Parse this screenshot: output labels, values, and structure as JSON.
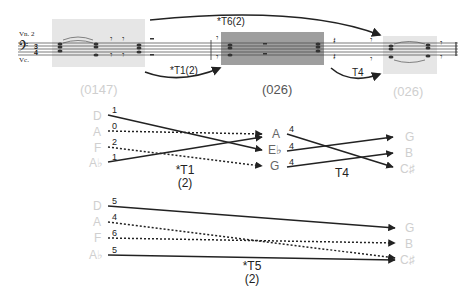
{
  "score": {
    "instrument_labels": [
      "Vn. 2",
      "Vc."
    ],
    "highlight_boxes": [
      {
        "name": "first-segment",
        "color": "#e6e6e6"
      },
      {
        "name": "middle-segment",
        "color": "#9e9e9e"
      },
      {
        "name": "last-segment",
        "color": "#e6e6e6"
      }
    ],
    "arrows": [
      {
        "label": "*T6(2)",
        "from": "first-segment",
        "to": "last-segment",
        "position": "above"
      },
      {
        "label": "*T1(2)",
        "from": "first-segment",
        "to": "middle-segment",
        "position": "below"
      },
      {
        "label": "T4",
        "from": "middle-segment",
        "to": "last-segment",
        "position": "below"
      }
    ],
    "set_labels": [
      {
        "text": "(0147)",
        "color": "#cfcfcf"
      },
      {
        "text": "(026)",
        "color": "#555555"
      },
      {
        "text": "(026)",
        "color": "#cfcfcf"
      }
    ]
  },
  "mapping_top": {
    "source": [
      "D",
      "A",
      "F",
      "A♭"
    ],
    "middle": [
      "A",
      "E♭",
      "G"
    ],
    "target": [
      "G",
      "B",
      "C♯"
    ],
    "first_operation": {
      "label": "*T1",
      "sub": "(2)"
    },
    "second_operation": {
      "label": "T4"
    },
    "first_edges": [
      {
        "from": "D",
        "to": "E♭",
        "distance": "1",
        "style": "solid"
      },
      {
        "from": "A",
        "to": "A",
        "distance": "0",
        "style": "dotted"
      },
      {
        "from": "F",
        "to": "G",
        "distance": "2",
        "style": "dotted"
      },
      {
        "from": "A♭",
        "to": "A",
        "distance": "1",
        "style": "solid"
      }
    ],
    "second_edges": [
      {
        "from": "A",
        "to": "C♯",
        "distance": "4",
        "style": "solid"
      },
      {
        "from": "E♭",
        "to": "G",
        "distance": "4",
        "style": "solid"
      },
      {
        "from": "G",
        "to": "B",
        "distance": "4",
        "style": "solid"
      }
    ]
  },
  "mapping_bottom": {
    "source": [
      "D",
      "A",
      "F",
      "A♭"
    ],
    "target": [
      "G",
      "B",
      "C♯"
    ],
    "operation": {
      "label": "*T5",
      "sub": "(2)"
    },
    "edges": [
      {
        "from": "D",
        "to": "G",
        "distance": "5",
        "style": "solid"
      },
      {
        "from": "A",
        "to": "C♯",
        "distance": "4",
        "style": "dotted"
      },
      {
        "from": "F",
        "to": "B",
        "distance": "6",
        "style": "dotted"
      },
      {
        "from": "A♭",
        "to": "C♯",
        "distance": "5",
        "style": "solid"
      }
    ]
  }
}
